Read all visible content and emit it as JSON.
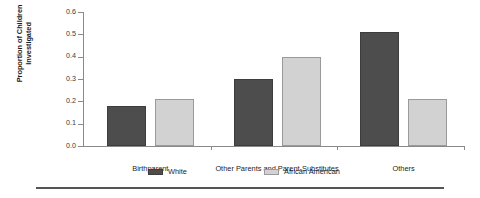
{
  "chart_data": {
    "type": "bar",
    "title": "",
    "xlabel": "",
    "ylabel": "Proportion of Children Investigated",
    "ylabel_line1": "Proportion of Children",
    "ylabel_line2": "Investigated",
    "categories": [
      "Birthparent",
      "Other Parents and Parent-Substitutes",
      "Others"
    ],
    "series": [
      {
        "name": "White",
        "color": "#4d4d4d",
        "values": [
          0.18,
          0.3,
          0.51
        ]
      },
      {
        "name": "African American",
        "color": "#d2d2d2",
        "values": [
          0.21,
          0.4,
          0.21
        ]
      }
    ],
    "ylim": [
      0.0,
      0.6
    ],
    "yticks": [
      0.0,
      0.1,
      0.2,
      0.3,
      0.4,
      0.5,
      0.6
    ],
    "ytick_labels": [
      "0.0",
      "0.1",
      "0.2",
      "0.3",
      "0.4",
      "0.5",
      "0.6"
    ],
    "grid": false,
    "legend_position": "bottom"
  }
}
